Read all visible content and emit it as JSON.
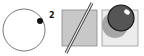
{
  "figure": {
    "panels": [
      {
        "id": "circle-with-dot",
        "label": "2",
        "icon": "circle-dot-icon"
      },
      {
        "id": "square-with-rod",
        "icon": "rod-crossing-square-icon"
      },
      {
        "id": "sphere-with-shadow",
        "icon": "sphere-shadow-icon"
      }
    ]
  },
  "colors": {
    "stroke": "#222222",
    "square_fill": "#c8c8c8",
    "light_square_fill": "#ececec",
    "sphere_fill": "#555555",
    "shadow_fill": "#9a9a9a"
  }
}
